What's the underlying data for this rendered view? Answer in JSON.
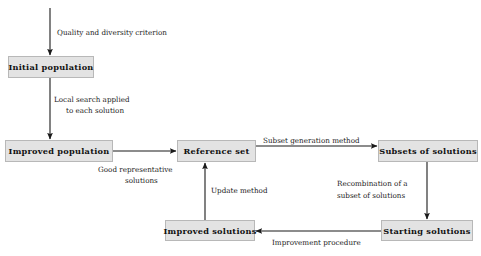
{
  "diagram": {
    "style": {
      "node_fill": "#e3e3e3",
      "node_border": "#b8b8b8",
      "arrow_color": "#1a1a1a",
      "text_color": "#111111",
      "background": "#ffffff"
    },
    "nodes": [
      {
        "id": "initial-population",
        "label": "Initial population",
        "x": 8,
        "y": 56,
        "w": 86,
        "h": 22
      },
      {
        "id": "improved-population",
        "label": "Improved population",
        "x": 5,
        "y": 140,
        "w": 108,
        "h": 22
      },
      {
        "id": "reference-set",
        "label": "Reference set",
        "x": 177,
        "y": 140,
        "w": 79,
        "h": 22
      },
      {
        "id": "subsets-of-solutions",
        "label": "Subsets of solutions",
        "x": 378,
        "y": 140,
        "w": 100,
        "h": 22
      },
      {
        "id": "improved-solutions",
        "label": "Improved solutions",
        "x": 165,
        "y": 220,
        "w": 90,
        "h": 21
      },
      {
        "id": "starting-solutions",
        "label": "Starting solutions",
        "x": 381,
        "y": 220,
        "w": 92,
        "h": 21
      }
    ],
    "edges": [
      {
        "id": "entry-to-initial",
        "from": "",
        "to": "initial-population",
        "direction": "down"
      },
      {
        "id": "initial-to-improved-population",
        "from": "initial-population",
        "to": "improved-population",
        "direction": "down"
      },
      {
        "id": "improved-population-to-refset",
        "from": "improved-population",
        "to": "reference-set",
        "direction": "right"
      },
      {
        "id": "refset-to-subsets",
        "from": "reference-set",
        "to": "subsets-of-solutions",
        "direction": "right"
      },
      {
        "id": "subsets-to-starting",
        "from": "subsets-of-solutions",
        "to": "starting-solutions",
        "direction": "down"
      },
      {
        "id": "starting-to-improved-solutions",
        "from": "starting-solutions",
        "to": "improved-solutions",
        "direction": "left"
      },
      {
        "id": "improved-solutions-to-refset",
        "from": "improved-solutions",
        "to": "reference-set",
        "direction": "up"
      }
    ],
    "edge_labels": [
      {
        "id": "quality-and-diversity-criterion",
        "text": "Quality and diversity criterion",
        "x": 57,
        "y": 28,
        "align": "left"
      },
      {
        "id": "local-search-applied",
        "text": "Local search applied",
        "x": 54,
        "y": 95,
        "align": "left"
      },
      {
        "id": "to-each-solution",
        "text": "to each solution",
        "x": 66,
        "y": 106,
        "align": "left"
      },
      {
        "id": "good-representative",
        "text": "Good representative",
        "x": 98,
        "y": 165,
        "align": "left"
      },
      {
        "id": "solutions",
        "text": "solutions",
        "x": 125,
        "y": 176,
        "align": "left"
      },
      {
        "id": "subset-generation-method",
        "text": "Subset generation method",
        "x": 263,
        "y": 136,
        "align": "left"
      },
      {
        "id": "update-method",
        "text": "Update method",
        "x": 211,
        "y": 186,
        "align": "left"
      },
      {
        "id": "recombination-of-a",
        "text": "Recombination of a",
        "x": 337,
        "y": 179,
        "align": "left"
      },
      {
        "id": "subset-of-solutions",
        "text": "subset of solutions",
        "x": 337,
        "y": 191,
        "align": "left"
      },
      {
        "id": "improvement-procedure",
        "text": "Improvement procedure",
        "x": 272,
        "y": 238,
        "align": "left"
      }
    ]
  }
}
